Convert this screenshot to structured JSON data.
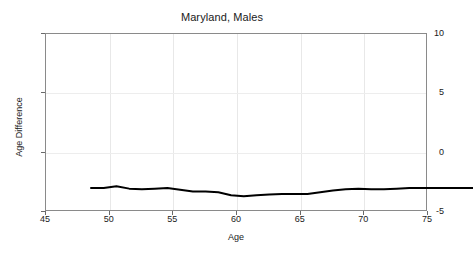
{
  "chart_data": {
    "type": "line",
    "title": "Maryland, Males",
    "xlabel": "Age",
    "ylabel": "Age Difference",
    "xlim": [
      45,
      75
    ],
    "ylim": [
      -5,
      10
    ],
    "xticks": [
      45,
      50,
      55,
      60,
      65,
      70,
      75
    ],
    "yticks": [
      -5,
      0,
      5,
      10
    ],
    "grid": true,
    "legend": null,
    "series": [
      {
        "name": "Age Difference",
        "color": "#000000",
        "x": [
          45,
          46,
          47,
          48,
          49,
          50,
          51,
          52,
          53,
          54,
          55,
          56,
          57,
          58,
          59,
          60,
          61,
          62,
          63,
          64,
          65,
          66,
          67,
          68,
          69,
          70,
          71,
          72,
          73,
          74,
          75
        ],
        "values": [
          -0.2,
          -0.2,
          -0.05,
          -0.25,
          -0.3,
          -0.25,
          -0.2,
          -0.35,
          -0.5,
          -0.5,
          -0.55,
          -0.8,
          -0.9,
          -0.8,
          -0.75,
          -0.7,
          -0.7,
          -0.7,
          -0.55,
          -0.4,
          -0.3,
          -0.25,
          -0.3,
          -0.3,
          -0.25,
          -0.2,
          -0.2,
          -0.2,
          -0.2,
          -0.2,
          -0.2
        ]
      }
    ]
  },
  "axis": {
    "ytick_labels": [
      "10",
      "5",
      "0",
      "-5"
    ],
    "xtick_labels": [
      "45",
      "50",
      "55",
      "60",
      "65",
      "70",
      "75"
    ]
  },
  "colors": {
    "line": "#000000",
    "frame": "#8a8a8a",
    "grid": "#e8e8e8",
    "background": "#ffffff",
    "text": "#1a1a1a"
  }
}
